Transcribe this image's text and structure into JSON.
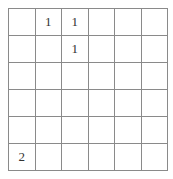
{
  "puzzle": {
    "rows": 6,
    "cols": 6,
    "line_color": "#8a8a8a",
    "cells": [
      [
        "",
        "1",
        "1",
        "",
        "",
        ""
      ],
      [
        "",
        "",
        "1",
        "",
        "",
        ""
      ],
      [
        "",
        "",
        "",
        "",
        "",
        ""
      ],
      [
        "",
        "",
        "",
        "",
        "",
        ""
      ],
      [
        "",
        "",
        "",
        "",
        "",
        ""
      ],
      [
        "2",
        "",
        "",
        "",
        "",
        ""
      ]
    ]
  }
}
